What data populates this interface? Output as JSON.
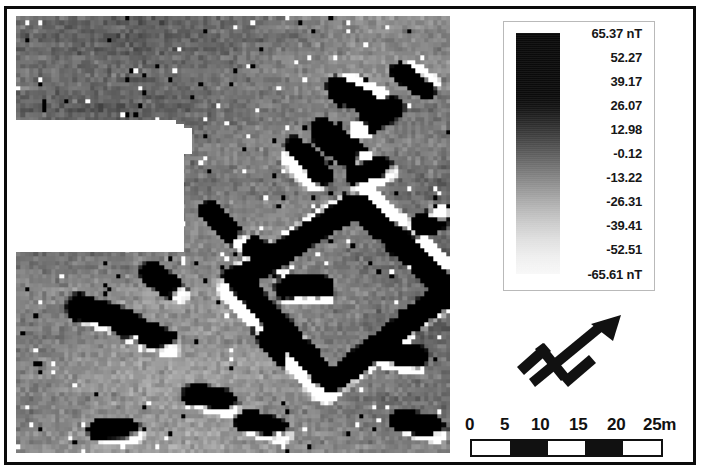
{
  "figure": {
    "border_color": "#0b0b0b",
    "background_color": "#ffffff"
  },
  "raster": {
    "name": "magnetometry-greyscale-image",
    "description": "Greyscale magnetic gradiometry survey plot showing a rhombus/diamond shaped enclosure anomaly in the centre-right and a rectangular blank (no data) area at the left",
    "nodata_label": "",
    "colors": {
      "mid_grey": "#9a9a9a",
      "dark": "#101010",
      "light": "#f2f2f2",
      "nodata": "#ffffff"
    }
  },
  "legend": {
    "name": "nt-colour-scale",
    "unit": "nT",
    "top_value": "65.37 nT",
    "bottom_value": "-65.61 nT",
    "labels": [
      "65.37 nT",
      "52.27",
      "39.17",
      "26.07",
      "12.98",
      "-0.12",
      "-13.22",
      "-26.31",
      "-39.41",
      "-52.51",
      "-65.61 nT"
    ],
    "values": [
      65.37,
      52.27,
      39.17,
      26.07,
      12.98,
      -0.12,
      -13.22,
      -26.31,
      -39.41,
      -52.51,
      -65.61
    ],
    "ramp_top_color": "#0a0a0a",
    "ramp_bottom_color": "#f8f8f8"
  },
  "north_arrow": {
    "name": "north-arrow",
    "letter": "N",
    "direction": "north-east"
  },
  "scalebar": {
    "name": "scale-bar",
    "unit": "m",
    "ticks": [
      "0",
      "5",
      "10",
      "15",
      "20",
      "25m"
    ],
    "tick_values": [
      0,
      5,
      10,
      15,
      20,
      25
    ],
    "segments": [
      "light",
      "dark",
      "light",
      "dark",
      "light"
    ],
    "total_length": 25
  },
  "chart_data": {
    "type": "heatmap",
    "title": "",
    "xlabel": "",
    "ylabel": "",
    "colorbar": {
      "label": "nT",
      "min": -65.61,
      "max": 65.37,
      "tick_values": [
        65.37,
        52.27,
        39.17,
        26.07,
        12.98,
        -0.12,
        -13.22,
        -26.31,
        -39.41,
        -52.51,
        -65.61
      ],
      "tick_labels": [
        "65.37 nT",
        "52.27",
        "39.17",
        "26.07",
        "12.98",
        "-0.12",
        "-13.22",
        "-26.31",
        "-39.41",
        "-52.51",
        "-65.61 nT"
      ],
      "ramp": "black-to-white"
    },
    "scale": {
      "unit": "m",
      "ticks": [
        0,
        5,
        10,
        15,
        20,
        25
      ],
      "bar_length_m": 25
    },
    "grid": false,
    "legend_position": "right",
    "features": [
      {
        "name": "rhombus-enclosure-anomaly",
        "note": "strong positive/negative dipolar ditch response forming a diamond outline, centre-right of survey"
      },
      {
        "name": "linear-anomaly-cluster",
        "note": "dark pixel cluster upper-centre of survey"
      },
      {
        "name": "no-data-block",
        "note": "white rectangular unsurveyed area, left-centre"
      }
    ]
  }
}
